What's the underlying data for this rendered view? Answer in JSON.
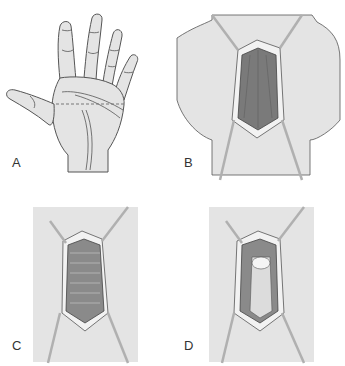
{
  "figure": {
    "colors": {
      "skin": "#e4e4e4",
      "outline": "#555555",
      "fascia_dark": "#7a7a7a",
      "fat_border": "#f2f2f2",
      "retractor": "#cfcfcf",
      "background": "#ffffff"
    },
    "panels": [
      {
        "id": "A",
        "label": "A",
        "content": "palm of hand with transverse dashed incision line"
      },
      {
        "id": "B",
        "label": "B",
        "content": "incision retracted exposing longitudinal fibers of palmar fascia"
      },
      {
        "id": "C",
        "label": "C",
        "content": "transverse fibers exposed between retracted edges"
      },
      {
        "id": "D",
        "label": "D",
        "content": "fascia elevated showing underlying tissue"
      }
    ]
  }
}
